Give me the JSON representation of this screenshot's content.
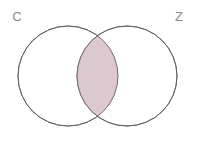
{
  "figure": {
    "type": "venn2",
    "background_color": "#ffffff",
    "width": 198,
    "height": 152
  },
  "sets": [
    {
      "id": "left",
      "label": "C",
      "label_x": 17,
      "label_y": 21,
      "center_x": 68,
      "center_y": 76,
      "radius": 50,
      "fill_color": "#ffffff",
      "stroke_color": "#5f5f5f"
    },
    {
      "id": "right",
      "label": "Z",
      "label_x": 179,
      "label_y": 21,
      "center_x": 127,
      "center_y": 76,
      "radius": 50,
      "fill_color": "#ffffff",
      "stroke_color": "#5f5f5f"
    }
  ],
  "intersection": {
    "name": "C-and-Z",
    "shaded": true,
    "fill_color": "#dcc9cf",
    "stroke_color": "#5f5f5f"
  },
  "style": {
    "stroke_width": 0.9,
    "label_color": "#8a8a8a",
    "label_font_size": 13
  }
}
